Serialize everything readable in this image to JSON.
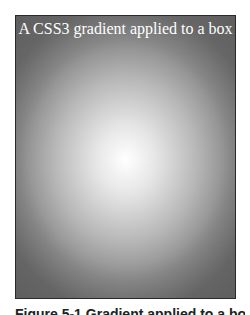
{
  "page": {
    "top_clipped_text": "",
    "figure": {
      "box_title": "A CSS3 gradient applied to a box",
      "gradient": {
        "type": "radial",
        "center_color": "#ffffff",
        "edge_color": "#6e6e6e",
        "border_color": "#2a2a2a"
      }
    },
    "caption_clipped": "Figure 5-1 Gradient applied to a box"
  }
}
